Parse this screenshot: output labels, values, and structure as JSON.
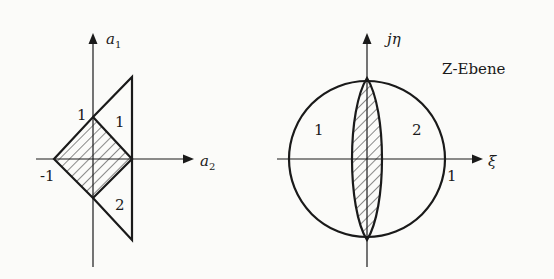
{
  "left_diagram": {
    "axis_vertical_label": "a",
    "axis_vertical_sub": "1",
    "axis_horizontal_label": "a",
    "axis_horizontal_sub": "2",
    "tick_top": "1",
    "tick_left": "-1",
    "region_upper": "1",
    "region_lower": "2"
  },
  "right_diagram": {
    "axis_vertical_label": "jη",
    "axis_horizontal_label": "ξ",
    "plane_title": "Z-Ebene",
    "tick_right": "1",
    "region_left": "1",
    "region_right": "2"
  }
}
